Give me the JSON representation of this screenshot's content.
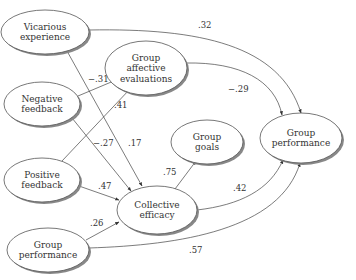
{
  "nodes": [
    {
      "id": "vicarious",
      "lines": [
        "Vicarious",
        "experience"
      ],
      "cx": 45,
      "cy": 32,
      "rx": 44,
      "ry": 22
    },
    {
      "id": "affective",
      "lines": [
        "Group",
        "affective",
        "evaluations"
      ],
      "cx": 146,
      "cy": 68,
      "rx": 41,
      "ry": 27
    },
    {
      "id": "negative",
      "lines": [
        "Negative",
        "feedback"
      ],
      "cx": 42,
      "cy": 104,
      "rx": 38,
      "ry": 22
    },
    {
      "id": "positive",
      "lines": [
        "Positive",
        "feedback"
      ],
      "cx": 42,
      "cy": 180,
      "rx": 38,
      "ry": 22
    },
    {
      "id": "goals",
      "lines": [
        "Group",
        "goals"
      ],
      "cx": 207,
      "cy": 142,
      "rx": 36,
      "ry": 22
    },
    {
      "id": "perf_right",
      "lines": [
        "Group",
        "performance"
      ],
      "cx": 301,
      "cy": 138,
      "rx": 41,
      "ry": 25
    },
    {
      "id": "efficacy",
      "lines": [
        "Collective",
        "efficacy"
      ],
      "cx": 157,
      "cy": 210,
      "rx": 40,
      "ry": 24
    },
    {
      "id": "perf_bottom",
      "lines": [
        "Group",
        "performance"
      ],
      "cx": 48,
      "cy": 250,
      "rx": 41,
      "ry": 22
    }
  ],
  "edges": [
    {
      "from": "vicarious",
      "to": "perf_right",
      "label": ".32",
      "lx": 198,
      "ly": 28
    },
    {
      "from": "vicarious",
      "to": "efficacy",
      "label": ".17",
      "lx": 128,
      "ly": 146
    },
    {
      "from": "negative",
      "to": "affective",
      "label": "−.31",
      "lx": 88,
      "ly": 82
    },
    {
      "from": "negative",
      "to": "efficacy",
      "label": "−.27",
      "lx": 93,
      "ly": 146
    },
    {
      "from": "positive",
      "to": "affective",
      "label": ".41",
      "lx": 114,
      "ly": 108
    },
    {
      "from": "positive",
      "to": "efficacy",
      "label": ".47",
      "lx": 98,
      "ly": 189
    },
    {
      "from": "affective",
      "to": "perf_right",
      "label": "−.29",
      "lx": 228,
      "ly": 92
    },
    {
      "from": "efficacy",
      "to": "goals",
      "label": ".75",
      "lx": 163,
      "ly": 175
    },
    {
      "from": "efficacy",
      "to": "perf_right",
      "label": ".42",
      "lx": 233,
      "ly": 191
    },
    {
      "from": "perf_bottom",
      "to": "efficacy",
      "label": ".26",
      "lx": 90,
      "ly": 226
    },
    {
      "from": "perf_bottom",
      "to": "perf_right",
      "label": ".57",
      "lx": 189,
      "ly": 253
    }
  ]
}
